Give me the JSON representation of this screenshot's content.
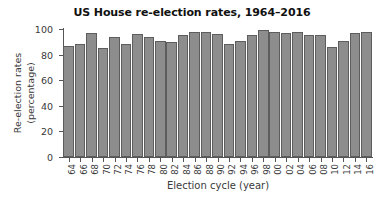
{
  "chart_data": {
    "type": "bar",
    "title": "US House re-election rates, 1964–2016",
    "xlabel": "Election cycle (year)",
    "ylabel_lines": [
      "Re-election rates",
      "(percentage)"
    ],
    "ylabel": "Re-election rates (percentage)",
    "categories": [
      "64",
      "66",
      "68",
      "70",
      "72",
      "74",
      "76",
      "78",
      "80",
      "82",
      "84",
      "86",
      "88",
      "90",
      "92",
      "94",
      "96",
      "98",
      "00",
      "02",
      "04",
      "06",
      "08",
      "10",
      "12",
      "14",
      "16"
    ],
    "values": [
      87,
      88,
      97,
      85,
      94,
      88,
      96,
      94,
      91,
      90,
      95,
      98,
      98,
      96,
      88,
      91,
      95,
      99,
      98,
      97,
      98,
      95,
      95,
      86,
      91,
      97,
      98
    ],
    "yticks": [
      0,
      20,
      40,
      60,
      80,
      100
    ],
    "ytick_labels": [
      "0",
      "20",
      "40",
      "60",
      "80",
      "100"
    ],
    "ylim": [
      0,
      100
    ],
    "grid": false,
    "legend": null,
    "bar_color": "#8d8d8d",
    "bar_edge_color": "#5d5d5d",
    "axis_color": "#555555",
    "title_color": "#111111",
    "text_color": "#3a3a3a"
  }
}
